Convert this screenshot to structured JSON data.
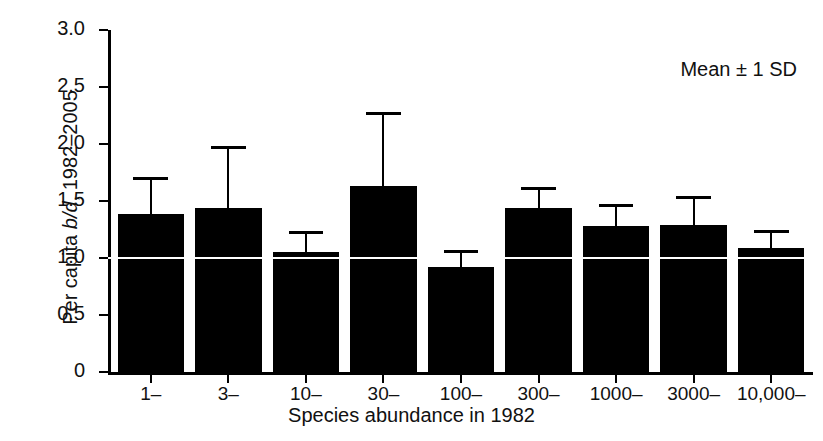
{
  "chart_data": {
    "type": "bar",
    "title": "",
    "subtitle": "",
    "xlabel": "Species abundance in 1982",
    "ylabel_plain": "Per capita b/d, 1982–2005",
    "ylabel_parts": {
      "prefix": "Per capita ",
      "italic": "b/d",
      "suffix": ", 1982–2005"
    },
    "annotation": "Mean ± 1 SD",
    "categories": [
      "1–",
      "3–",
      "10–",
      "30–",
      "100–",
      "300–",
      "1000–",
      "3000–",
      "10,000–"
    ],
    "values": [
      1.39,
      1.44,
      1.05,
      1.63,
      0.92,
      1.44,
      1.28,
      1.29,
      1.09
    ],
    "error_upper": [
      0.32,
      0.54,
      0.19,
      0.65,
      0.15,
      0.18,
      0.19,
      0.25,
      0.16
    ],
    "error_upper_absolute": [
      1.71,
      1.98,
      1.24,
      2.28,
      1.07,
      1.62,
      1.47,
      1.54,
      1.25
    ],
    "error_type": "1 SD (upper only shown)",
    "ylim": [
      0,
      3.0
    ],
    "yticks": [
      0,
      0.5,
      1.0,
      1.5,
      2.0,
      2.5,
      3.0
    ],
    "ytick_labels": [
      "0",
      "0.5",
      "1.0",
      "1.5",
      "2.0",
      "2.5",
      "3.0"
    ],
    "reference_line": 1.0,
    "grid": false,
    "legend_position": "top-right",
    "bar_color": "#000000",
    "background_color": "#ffffff"
  }
}
